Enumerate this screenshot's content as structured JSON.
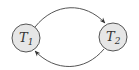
{
  "diagram": {
    "type": "state-transition",
    "nodes": [
      {
        "id": "T1",
        "label": "T",
        "subscript": "1",
        "cx": 26,
        "cy": 38,
        "r": 14
      },
      {
        "id": "T2",
        "label": "T",
        "subscript": "2",
        "cx": 113,
        "cy": 37,
        "r": 14
      }
    ],
    "edges": [
      {
        "from": "T1",
        "to": "T2",
        "curve": "top"
      },
      {
        "from": "T2",
        "to": "T1",
        "curve": "bottom"
      }
    ],
    "colors": {
      "node_fill": "#e6e6e6",
      "node_stroke": "#555555",
      "edge": "#555555",
      "text": "#333333"
    }
  }
}
